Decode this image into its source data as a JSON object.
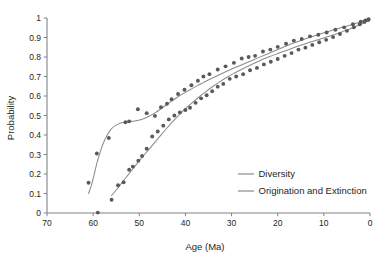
{
  "chart_data": {
    "type": "scatter",
    "title": "",
    "xlabel": "Age (Ma)",
    "ylabel": "Probability",
    "xlim": [
      70,
      0
    ],
    "ylim": [
      0,
      1
    ],
    "x_reversed": true,
    "grid": false,
    "legend_position": "bottom-right",
    "xticks": [
      70,
      60,
      50,
      40,
      30,
      20,
      10,
      0
    ],
    "xtick_labels": [
      "70",
      "60",
      "50",
      "40",
      "30",
      "20",
      "10",
      "0"
    ],
    "yticks": [
      0,
      0.1,
      0.2,
      0.3,
      0.4,
      0.5,
      0.6,
      0.7,
      0.8,
      0.9,
      1
    ],
    "ytick_labels": [
      "0",
      "0.1",
      "0.2",
      "0.3",
      "0.4",
      "0.5",
      "0.6",
      "0.7",
      "0.8",
      "0.9",
      "1"
    ],
    "series": [
      {
        "name": "Diversity",
        "color": "#8c8c8c",
        "marker_color": "#58595b",
        "curve": [
          [
            61.0,
            0.1
          ],
          [
            60.4,
            0.14
          ],
          [
            59.8,
            0.195
          ],
          [
            59.2,
            0.255
          ],
          [
            58.5,
            0.31
          ],
          [
            57.8,
            0.358
          ],
          [
            57.0,
            0.398
          ],
          [
            56.2,
            0.428
          ],
          [
            55.2,
            0.448
          ],
          [
            54.0,
            0.461
          ],
          [
            52.5,
            0.468
          ],
          [
            51.0,
            0.472
          ],
          [
            49.5,
            0.48
          ],
          [
            48.0,
            0.495
          ],
          [
            46.5,
            0.515
          ],
          [
            45.0,
            0.54
          ],
          [
            43.5,
            0.565
          ],
          [
            42.0,
            0.59
          ],
          [
            40.5,
            0.612
          ],
          [
            39.0,
            0.632
          ],
          [
            37.5,
            0.652
          ],
          [
            36.0,
            0.67
          ],
          [
            34.5,
            0.688
          ],
          [
            33.0,
            0.705
          ],
          [
            31.5,
            0.722
          ],
          [
            30.0,
            0.738
          ],
          [
            28.0,
            0.758
          ],
          [
            26.0,
            0.778
          ],
          [
            24.0,
            0.798
          ],
          [
            22.0,
            0.818
          ],
          [
            20.0,
            0.838
          ],
          [
            18.0,
            0.858
          ],
          [
            16.0,
            0.876
          ],
          [
            14.0,
            0.893
          ],
          [
            12.0,
            0.909
          ],
          [
            10.0,
            0.924
          ],
          [
            8.0,
            0.938
          ],
          [
            6.0,
            0.952
          ],
          [
            4.0,
            0.966
          ],
          [
            2.0,
            0.981
          ],
          [
            0.5,
            0.993
          ]
        ],
        "points": [
          [
            61.0,
            0.155
          ],
          [
            59.2,
            0.305
          ],
          [
            56.6,
            0.385
          ],
          [
            53.0,
            0.465
          ],
          [
            52.2,
            0.47
          ],
          [
            50.3,
            0.532
          ],
          [
            48.4,
            0.512
          ],
          [
            46.6,
            0.498
          ],
          [
            45.3,
            0.542
          ],
          [
            44.0,
            0.56
          ],
          [
            43.0,
            0.583
          ],
          [
            41.6,
            0.61
          ],
          [
            40.2,
            0.632
          ],
          [
            38.7,
            0.655
          ],
          [
            37.3,
            0.678
          ],
          [
            36.1,
            0.7
          ],
          [
            34.8,
            0.712
          ],
          [
            33.0,
            0.736
          ],
          [
            31.3,
            0.752
          ],
          [
            29.5,
            0.77
          ],
          [
            27.8,
            0.792
          ],
          [
            26.3,
            0.8
          ],
          [
            24.9,
            0.806
          ],
          [
            23.2,
            0.828
          ],
          [
            21.6,
            0.838
          ],
          [
            20.0,
            0.852
          ],
          [
            18.2,
            0.868
          ],
          [
            16.5,
            0.884
          ],
          [
            14.8,
            0.892
          ],
          [
            13.0,
            0.906
          ],
          [
            11.2,
            0.914
          ],
          [
            9.4,
            0.926
          ],
          [
            7.5,
            0.94
          ],
          [
            5.6,
            0.952
          ],
          [
            3.7,
            0.968
          ],
          [
            2.0,
            0.981
          ],
          [
            1.0,
            0.988
          ],
          [
            0.3,
            0.994
          ]
        ]
      },
      {
        "name": "Origination and Extinction",
        "color": "#8c8c8c",
        "marker_color": "#58595b",
        "curve": [
          [
            56.0,
            0.09
          ],
          [
            55.0,
            0.118
          ],
          [
            54.0,
            0.148
          ],
          [
            53.0,
            0.178
          ],
          [
            52.0,
            0.208
          ],
          [
            51.0,
            0.238
          ],
          [
            50.0,
            0.268
          ],
          [
            49.0,
            0.296
          ],
          [
            48.0,
            0.324
          ],
          [
            47.0,
            0.352
          ],
          [
            46.0,
            0.38
          ],
          [
            45.0,
            0.408
          ],
          [
            44.0,
            0.436
          ],
          [
            43.0,
            0.462
          ],
          [
            42.0,
            0.488
          ],
          [
            41.0,
            0.512
          ],
          [
            40.0,
            0.535
          ],
          [
            38.5,
            0.566
          ],
          [
            37.0,
            0.596
          ],
          [
            35.5,
            0.624
          ],
          [
            34.0,
            0.65
          ],
          [
            32.5,
            0.674
          ],
          [
            31.0,
            0.696
          ],
          [
            29.5,
            0.716
          ],
          [
            28.0,
            0.735
          ],
          [
            26.0,
            0.758
          ],
          [
            24.0,
            0.78
          ],
          [
            22.0,
            0.8
          ],
          [
            20.0,
            0.818
          ],
          [
            18.0,
            0.835
          ],
          [
            16.0,
            0.852
          ],
          [
            14.0,
            0.868
          ],
          [
            12.0,
            0.883
          ],
          [
            10.0,
            0.898
          ],
          [
            8.0,
            0.913
          ],
          [
            6.0,
            0.93
          ],
          [
            4.0,
            0.948
          ],
          [
            2.0,
            0.968
          ],
          [
            0.5,
            0.986
          ]
        ],
        "points": [
          [
            59.0,
            0.002
          ],
          [
            56.0,
            0.068
          ],
          [
            54.6,
            0.142
          ],
          [
            53.4,
            0.158
          ],
          [
            52.2,
            0.222
          ],
          [
            51.4,
            0.238
          ],
          [
            50.2,
            0.268
          ],
          [
            49.4,
            0.292
          ],
          [
            48.4,
            0.33
          ],
          [
            47.2,
            0.392
          ],
          [
            46.0,
            0.418
          ],
          [
            44.8,
            0.448
          ],
          [
            43.6,
            0.48
          ],
          [
            42.4,
            0.5
          ],
          [
            41.2,
            0.516
          ],
          [
            40.0,
            0.528
          ],
          [
            39.0,
            0.54
          ],
          [
            37.8,
            0.565
          ],
          [
            36.6,
            0.588
          ],
          [
            35.4,
            0.604
          ],
          [
            34.2,
            0.624
          ],
          [
            33.0,
            0.648
          ],
          [
            31.8,
            0.662
          ],
          [
            30.4,
            0.688
          ],
          [
            29.0,
            0.7
          ],
          [
            27.5,
            0.712
          ],
          [
            26.0,
            0.732
          ],
          [
            24.5,
            0.744
          ],
          [
            23.0,
            0.762
          ],
          [
            21.5,
            0.776
          ],
          [
            20.0,
            0.79
          ],
          [
            18.5,
            0.806
          ],
          [
            17.0,
            0.82
          ],
          [
            15.5,
            0.838
          ],
          [
            14.0,
            0.848
          ],
          [
            12.5,
            0.862
          ],
          [
            11.0,
            0.876
          ],
          [
            9.5,
            0.888
          ],
          [
            8.0,
            0.902
          ],
          [
            6.5,
            0.918
          ],
          [
            5.0,
            0.934
          ],
          [
            3.5,
            0.952
          ],
          [
            2.2,
            0.968
          ],
          [
            1.2,
            0.98
          ],
          [
            0.4,
            0.99
          ]
        ]
      }
    ]
  },
  "legend": {
    "items": [
      {
        "label": "Diversity"
      },
      {
        "label": "Origination and Extinction"
      }
    ]
  },
  "colors": {
    "axis": "#808285",
    "text": "#231f20",
    "curve": "#8c8c8c",
    "marker": "#58595b",
    "background": "#ffffff"
  }
}
